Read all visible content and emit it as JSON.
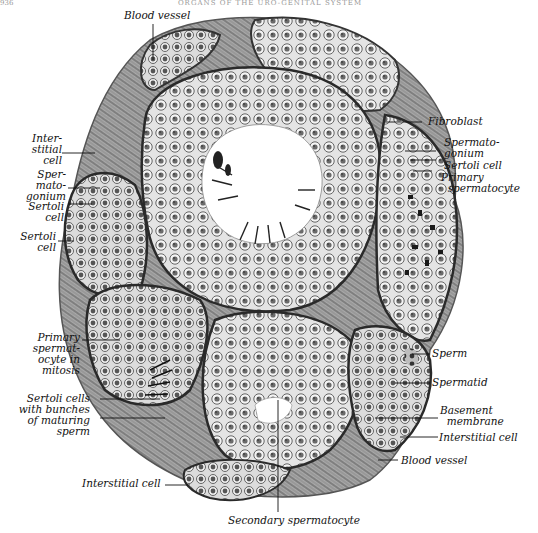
{
  "page": {
    "header_text": "ORGANS OF THE URO-GENITAL SYSTEM",
    "page_number": "936"
  },
  "figure": {
    "colors": {
      "ink": "#111111",
      "tissue_dark": "#3a3a3a",
      "tissue_mid": "#8a8a8a",
      "tissue_light": "#d6d6d6",
      "background": "#ffffff"
    },
    "labels": {
      "blood_vessel_top": "Blood vessel",
      "interstitial_cell_left": "Inter-\nstitial\ncell",
      "spermatogonium_left": "Sper-\nmato-\ngonium",
      "sertoli_cell_left_1": "Sertoli\ncell",
      "sertoli_cell_left_2": "Sertoli\ncell",
      "primary_spermatocyte_mitosis": "Primary\nspermat-\nocyte in\nmitosis",
      "sertoli_cells_bunches": "Sertoli cells\nwith bunches\nof maturing\nsperm",
      "interstitial_cell_bottom": "Interstitial cell",
      "secondary_spermatocyte": "Secondary spermatocyte",
      "fibroblast": "Fibroblast",
      "spermatogonium_right": "Spermato-\ngonium",
      "sertoli_cell_right": "Sertoli cell",
      "primary_spermatocyte_right": "Primary\n  spermatocyte",
      "sperm": "Sperm",
      "spermatid": "Spermatid",
      "basement_membrane": "Basement\n  membrane",
      "interstitial_cell_right": "Interstitial cell",
      "blood_vessel_right": "Blood vessel"
    }
  }
}
